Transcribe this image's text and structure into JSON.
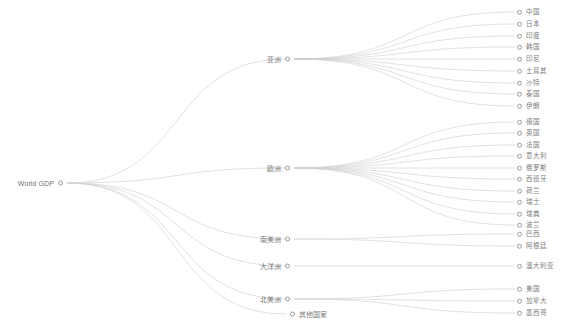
{
  "diagram": {
    "title": "World GDP",
    "type": "tree",
    "orientation": "left-to-right",
    "edge_color": "#d0d0d0",
    "node_stroke_color": "#9a9a9a",
    "label_color": "#7d7d7d",
    "background_color": "#ffffff"
  },
  "root": {
    "id": "root",
    "label": "World GDP",
    "x": 63,
    "y": 183,
    "label_side": "left"
  },
  "branches": [
    {
      "id": "asia",
      "label": "亚洲",
      "x": 290,
      "y": 59,
      "label_side": "left"
    },
    {
      "id": "europe",
      "label": "欧洲",
      "x": 290,
      "y": 168,
      "label_side": "left"
    },
    {
      "id": "south-america",
      "label": "南美洲",
      "x": 290,
      "y": 239,
      "label_side": "left"
    },
    {
      "id": "oceania",
      "label": "大洋洲",
      "x": 290,
      "y": 266,
      "label_side": "left"
    },
    {
      "id": "north-america",
      "label": "北美洲",
      "x": 290,
      "y": 299,
      "label_side": "left"
    },
    {
      "id": "other",
      "label": "其他国家",
      "x": 290,
      "y": 314,
      "label_side": "right"
    }
  ],
  "leaves": [
    {
      "id": "china",
      "label": "中国",
      "parent": "asia",
      "x": 517,
      "y": 12
    },
    {
      "id": "japan",
      "label": "日本",
      "parent": "asia",
      "x": 517,
      "y": 24
    },
    {
      "id": "india",
      "label": "印度",
      "parent": "asia",
      "x": 517,
      "y": 36
    },
    {
      "id": "korea",
      "label": "韩国",
      "parent": "asia",
      "x": 517,
      "y": 47
    },
    {
      "id": "indonesia",
      "label": "印尼",
      "parent": "asia",
      "x": 517,
      "y": 59
    },
    {
      "id": "turkey",
      "label": "土耳其",
      "parent": "asia",
      "x": 517,
      "y": 71
    },
    {
      "id": "saudi",
      "label": "沙特",
      "parent": "asia",
      "x": 517,
      "y": 83
    },
    {
      "id": "thailand",
      "label": "泰国",
      "parent": "asia",
      "x": 517,
      "y": 94
    },
    {
      "id": "iran",
      "label": "伊朗",
      "parent": "asia",
      "x": 517,
      "y": 106
    },
    {
      "id": "germany",
      "label": "德国",
      "parent": "europe",
      "x": 517,
      "y": 122
    },
    {
      "id": "uk",
      "label": "英国",
      "parent": "europe",
      "x": 517,
      "y": 133
    },
    {
      "id": "france",
      "label": "法国",
      "parent": "europe",
      "x": 517,
      "y": 145
    },
    {
      "id": "italy",
      "label": "意大利",
      "parent": "europe",
      "x": 517,
      "y": 156
    },
    {
      "id": "russia",
      "label": "俄罗斯",
      "parent": "europe",
      "x": 517,
      "y": 168
    },
    {
      "id": "spain",
      "label": "西班牙",
      "parent": "europe",
      "x": 517,
      "y": 179
    },
    {
      "id": "netherlands",
      "label": "荷兰",
      "parent": "europe",
      "x": 517,
      "y": 191
    },
    {
      "id": "switzerland",
      "label": "瑞士",
      "parent": "europe",
      "x": 517,
      "y": 202
    },
    {
      "id": "sweden",
      "label": "瑞典",
      "parent": "europe",
      "x": 517,
      "y": 214
    },
    {
      "id": "poland",
      "label": "波兰",
      "parent": "europe",
      "x": 517,
      "y": 225
    },
    {
      "id": "brazil",
      "label": "巴西",
      "parent": "south-america",
      "x": 517,
      "y": 234
    },
    {
      "id": "argentina",
      "label": "阿根廷",
      "parent": "south-america",
      "x": 517,
      "y": 246
    },
    {
      "id": "australia",
      "label": "澳大利亚",
      "parent": "oceania",
      "x": 517,
      "y": 266
    },
    {
      "id": "usa",
      "label": "美国",
      "parent": "north-america",
      "x": 517,
      "y": 289
    },
    {
      "id": "canada",
      "label": "加拿大",
      "parent": "north-america",
      "x": 517,
      "y": 301
    },
    {
      "id": "mexico",
      "label": "墨西哥",
      "parent": "north-america",
      "x": 517,
      "y": 313
    }
  ]
}
